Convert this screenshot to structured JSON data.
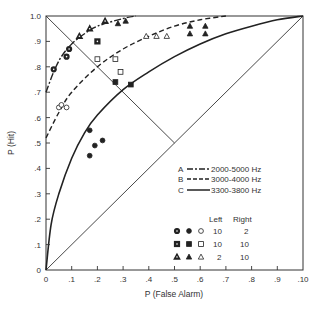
{
  "chart_data": {
    "type": "line",
    "title": "",
    "xlabel": "P (False Alarm)",
    "ylabel": "P (Hit)",
    "xlim": [
      0,
      1.0
    ],
    "ylim": [
      0,
      1.0
    ],
    "grid": false,
    "x_ticks": [
      "0",
      ".1",
      ".2",
      ".3",
      ".4",
      ".5",
      ".6",
      ".7",
      ".8",
      ".9",
      ".10"
    ],
    "y_ticks": [
      "0",
      ".1",
      ".2",
      ".3",
      ".4",
      ".5",
      ".6",
      ".7",
      ".8",
      ".9",
      "1.0"
    ],
    "reference_lines": [
      {
        "name": "chance diagonal",
        "points": [
          [
            0,
            0
          ],
          [
            1,
            1
          ]
        ]
      },
      {
        "name": "negative diagonal",
        "points": [
          [
            0,
            1
          ],
          [
            0.5,
            0.5
          ]
        ]
      }
    ],
    "series": [
      {
        "name": "A",
        "label": "2000-5000 Hz",
        "style": "dash-dot",
        "points": [
          [
            0,
            0.7
          ],
          [
            0.03,
            0.78
          ],
          [
            0.06,
            0.84
          ],
          [
            0.1,
            0.89
          ],
          [
            0.15,
            0.93
          ],
          [
            0.2,
            0.96
          ],
          [
            0.3,
            0.99
          ],
          [
            0.35,
            1.0
          ]
        ]
      },
      {
        "name": "B",
        "label": "3000-4000 Hz",
        "style": "dashed",
        "points": [
          [
            0,
            0.52
          ],
          [
            0.05,
            0.62
          ],
          [
            0.1,
            0.7
          ],
          [
            0.2,
            0.8
          ],
          [
            0.3,
            0.87
          ],
          [
            0.4,
            0.92
          ],
          [
            0.5,
            0.96
          ],
          [
            0.6,
            0.985
          ],
          [
            0.7,
            1.0
          ]
        ]
      },
      {
        "name": "C",
        "label": "3300-3800 Hz",
        "style": "solid",
        "points": [
          [
            0,
            0
          ],
          [
            0.02,
            0.18
          ],
          [
            0.05,
            0.3
          ],
          [
            0.1,
            0.44
          ],
          [
            0.15,
            0.54
          ],
          [
            0.2,
            0.61
          ],
          [
            0.3,
            0.71
          ],
          [
            0.4,
            0.78
          ],
          [
            0.5,
            0.84
          ],
          [
            0.6,
            0.89
          ],
          [
            0.7,
            0.93
          ],
          [
            0.8,
            0.96
          ],
          [
            0.9,
            0.985
          ],
          [
            1.0,
            1.0
          ]
        ]
      }
    ],
    "scatter": [
      {
        "marker": "circle",
        "fill": "half",
        "left": 10,
        "right": 2,
        "points": [
          [
            0.03,
            0.79
          ],
          [
            0.09,
            0.87
          ],
          [
            0.08,
            0.84
          ]
        ]
      },
      {
        "marker": "circle",
        "fill": "filled",
        "left": 10,
        "right": 2,
        "points": [
          [
            0.17,
            0.55
          ],
          [
            0.19,
            0.49
          ],
          [
            0.22,
            0.51
          ],
          [
            0.17,
            0.45
          ]
        ]
      },
      {
        "marker": "circle",
        "fill": "open",
        "left": 10,
        "right": 2,
        "points": [
          [
            0.05,
            0.64
          ],
          [
            0.06,
            0.65
          ],
          [
            0.08,
            0.64
          ]
        ]
      },
      {
        "marker": "square",
        "fill": "half",
        "left": 10,
        "right": 10,
        "points": [
          [
            0.2,
            0.9
          ]
        ]
      },
      {
        "marker": "square",
        "fill": "filled",
        "left": 10,
        "right": 10,
        "points": [
          [
            0.27,
            0.74
          ],
          [
            0.33,
            0.73
          ]
        ]
      },
      {
        "marker": "square",
        "fill": "open",
        "left": 10,
        "right": 10,
        "points": [
          [
            0.2,
            0.83
          ],
          [
            0.27,
            0.83
          ],
          [
            0.29,
            0.78
          ]
        ]
      },
      {
        "marker": "triangle",
        "fill": "half",
        "left": 2,
        "right": 10,
        "points": [
          [
            0.13,
            0.92
          ],
          [
            0.17,
            0.95
          ],
          [
            0.23,
            0.98
          ]
        ]
      },
      {
        "marker": "triangle",
        "fill": "filled",
        "left": 2,
        "right": 10,
        "points": [
          [
            0.28,
            0.97
          ],
          [
            0.31,
            0.98
          ],
          [
            0.56,
            0.96
          ],
          [
            0.62,
            0.96
          ],
          [
            0.56,
            0.93
          ],
          [
            0.62,
            0.93
          ]
        ]
      },
      {
        "marker": "triangle",
        "fill": "open",
        "left": 2,
        "right": 10,
        "points": [
          [
            0.39,
            0.92
          ],
          [
            0.43,
            0.92
          ],
          [
            0.47,
            0.92
          ]
        ]
      }
    ],
    "legend": {
      "lines": [
        {
          "key": "A",
          "label": "2000-5000 Hz"
        },
        {
          "key": "B",
          "label": "3000-4000 Hz"
        },
        {
          "key": "C",
          "label": "3300-3800 Hz"
        }
      ],
      "table_header": {
        "left": "Left",
        "right": "Right"
      },
      "table_rows": [
        {
          "marker": "circle",
          "left": "10",
          "right": "2"
        },
        {
          "marker": "square",
          "left": "10",
          "right": "10"
        },
        {
          "marker": "triangle",
          "left": "2",
          "right": "10"
        }
      ],
      "position": "lower right"
    }
  }
}
